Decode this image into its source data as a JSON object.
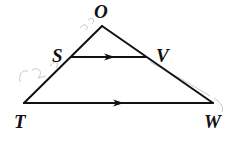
{
  "diagram": {
    "type": "geometry-triangle-with-parallel-segment",
    "points": {
      "O": {
        "label": "O",
        "x": 102,
        "y": 26
      },
      "S": {
        "label": "S",
        "x": 71,
        "y": 57
      },
      "V": {
        "label": "V",
        "x": 146,
        "y": 57
      },
      "T": {
        "label": "T",
        "x": 24,
        "y": 103
      },
      "W": {
        "label": "W",
        "x": 213,
        "y": 103
      }
    },
    "segments": [
      "OT",
      "OW",
      "TW",
      "SV"
    ],
    "parallel_marks": [
      {
        "segment": "SV",
        "marker": "arrow"
      },
      {
        "segment": "TW",
        "marker": "arrow"
      }
    ],
    "labels": {
      "O": "O",
      "S": "S",
      "V": "V",
      "T": "T",
      "W": "W"
    },
    "handwriting_note": "faint pencil marks near side OT",
    "colors": {
      "line": "#111111",
      "background": "#ffffff",
      "pencil": "#c8c8c8"
    }
  }
}
